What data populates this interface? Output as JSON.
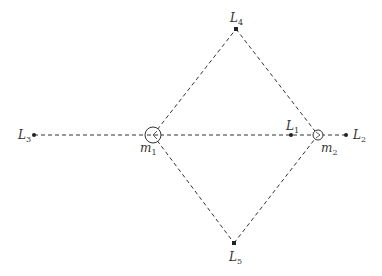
{
  "diagram": {
    "title": "",
    "masses": [
      {
        "id": "m1",
        "label": "m",
        "subscript": "1",
        "x": 153,
        "y": 135,
        "r": 8
      },
      {
        "id": "m2",
        "label": "m",
        "subscript": "2",
        "x": 318,
        "y": 135,
        "r": 5
      }
    ],
    "points": [
      {
        "id": "L1",
        "label": "L",
        "subscript": "1",
        "x": 291,
        "y": 135
      },
      {
        "id": "L2",
        "label": "L",
        "subscript": "2",
        "x": 346,
        "y": 135
      },
      {
        "id": "L3",
        "label": "L",
        "subscript": "3",
        "x": 34,
        "y": 135
      },
      {
        "id": "L4",
        "label": "L",
        "subscript": "4",
        "x": 236,
        "y": 29
      },
      {
        "id": "L5",
        "label": "L",
        "subscript": "5",
        "x": 234,
        "y": 243
      }
    ],
    "lines": [
      {
        "from": "L3",
        "to": "L2",
        "style": "dashed"
      },
      {
        "from": "m1",
        "to": "L4",
        "style": "dashed"
      },
      {
        "from": "L4",
        "to": "m2",
        "style": "dashed"
      },
      {
        "from": "m1",
        "to": "L5",
        "style": "dashed"
      },
      {
        "from": "L5",
        "to": "m2",
        "style": "dashed"
      }
    ]
  }
}
